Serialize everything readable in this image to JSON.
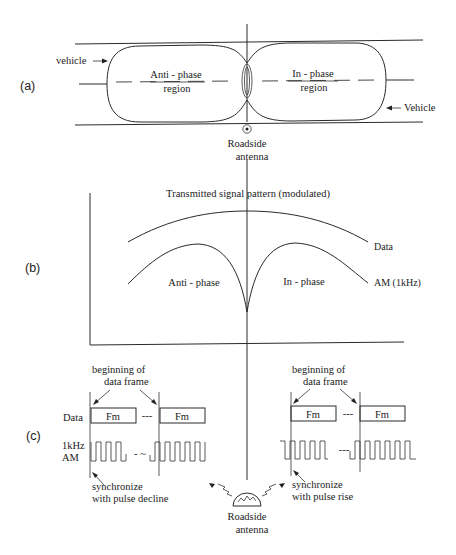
{
  "panels": {
    "a": {
      "label": "(a)",
      "vehicle_left": "vehicle",
      "vehicle_right": "Vehicle",
      "anti_phase_line1": "Anti - phase",
      "anti_phase_line2": "region",
      "in_phase_line1": "In - phase",
      "in_phase_line2": "region",
      "antenna_line1": "Roadside",
      "antenna_line2": "antenna"
    },
    "b": {
      "label": "(b)",
      "title": "Transmitted signal pattern (modulated)",
      "curve_data_label": "Data",
      "curve_am_label": "AM (1kHz)",
      "anti_phase": "Anti - phase",
      "in_phase": "In - phase"
    },
    "c": {
      "label": "(c)",
      "left": {
        "frame_line1": "beginning of",
        "frame_line2": "data frame",
        "data_label": "Data",
        "am_line1": "1kHz",
        "am_line2": "AM",
        "frame_box_1": "Fm",
        "frame_box_2": "Fm",
        "ellipsis": "---",
        "sync_line1": "synchronize",
        "sync_line2": "with pulse decline"
      },
      "right": {
        "frame_line1": "beginning of",
        "frame_line2": "data frame",
        "frame_box_1": "Fm",
        "frame_box_2": "Fm",
        "ellipsis": "---",
        "sync_line1": "synchronize",
        "sync_line2": "with pulse rise"
      },
      "antenna_line1": "Roadside",
      "antenna_line2": "antenna"
    }
  }
}
